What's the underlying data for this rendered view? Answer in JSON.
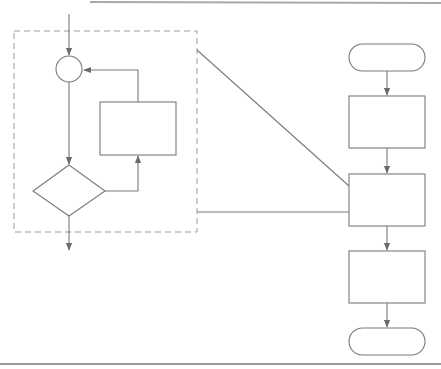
{
  "diagram": {
    "type": "flowchart",
    "colors": {
      "stroke": "#7a7a7a",
      "dashed_border": "#9a9a9a",
      "background": "#ffffff"
    },
    "main_flow": {
      "nodes": [
        {
          "id": "start",
          "shape": "terminator",
          "label": ""
        },
        {
          "id": "process-1",
          "shape": "rectangle",
          "label": ""
        },
        {
          "id": "process-2",
          "shape": "rectangle",
          "label": "",
          "expanded_in_detail": true
        },
        {
          "id": "process-3",
          "shape": "rectangle",
          "label": ""
        },
        {
          "id": "end",
          "shape": "terminator",
          "label": ""
        }
      ],
      "edges": [
        {
          "from": "start",
          "to": "process-1"
        },
        {
          "from": "process-1",
          "to": "process-2"
        },
        {
          "from": "process-2",
          "to": "process-3"
        },
        {
          "from": "process-3",
          "to": "end"
        }
      ]
    },
    "detail_panel": {
      "border": "dashed",
      "nodes": [
        {
          "id": "junction",
          "shape": "circle",
          "label": ""
        },
        {
          "id": "decision",
          "shape": "diamond",
          "label": ""
        },
        {
          "id": "loop-body",
          "shape": "rectangle",
          "label": ""
        }
      ],
      "edges": [
        {
          "from": "entry",
          "to": "junction"
        },
        {
          "from": "junction",
          "to": "decision"
        },
        {
          "from": "decision",
          "to": "loop-body"
        },
        {
          "from": "loop-body",
          "to": "junction"
        },
        {
          "from": "decision",
          "to": "exit"
        }
      ]
    }
  }
}
